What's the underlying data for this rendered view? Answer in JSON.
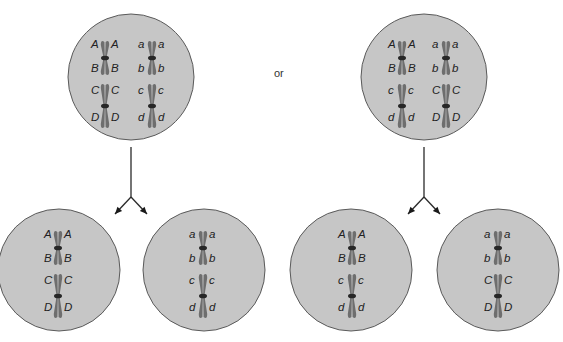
{
  "connector_label": "or",
  "colors": {
    "cell_fill": "#c6c6c6",
    "cell_stroke": "#5a5a5a",
    "chromatid": "#6e6e6e",
    "centromere": "#262626",
    "text": "#222222"
  },
  "arrangements": [
    {
      "name": "arrangement-1",
      "parent_cell": {
        "cx": 131,
        "cy": 77,
        "r": 63,
        "chromosomes": [
          {
            "x": 105,
            "cy": 58,
            "size": "small",
            "left_top": "A",
            "right_top": "A",
            "left_bottom": "B",
            "right_bottom": "B"
          },
          {
            "x": 152,
            "cy": 58,
            "size": "small",
            "left_top": "a",
            "right_top": "a",
            "left_bottom": "b",
            "right_bottom": "b"
          },
          {
            "x": 105,
            "cy": 106,
            "size": "large",
            "left_top": "C",
            "right_top": "C",
            "left_bottom": "D",
            "right_bottom": "D"
          },
          {
            "x": 152,
            "cy": 106,
            "size": "large",
            "left_top": "c",
            "right_top": "c",
            "left_bottom": "d",
            "right_bottom": "d"
          }
        ]
      },
      "daughter_cells": [
        {
          "cx": 59,
          "cy": 270,
          "r": 61,
          "chromosomes": [
            {
              "x": 58,
              "cy": 248,
              "size": "small",
              "left_top": "A",
              "right_top": "A",
              "left_bottom": "B",
              "right_bottom": "B"
            },
            {
              "x": 58,
              "cy": 296,
              "size": "large",
              "left_top": "C",
              "right_top": "C",
              "left_bottom": "D",
              "right_bottom": "D"
            }
          ]
        },
        {
          "cx": 204,
          "cy": 270,
          "r": 61,
          "chromosomes": [
            {
              "x": 203,
              "cy": 248,
              "size": "small",
              "left_top": "a",
              "right_top": "a",
              "left_bottom": "b",
              "right_bottom": "b"
            },
            {
              "x": 203,
              "cy": 296,
              "size": "large",
              "left_top": "c",
              "right_top": "c",
              "left_bottom": "d",
              "right_bottom": "d"
            }
          ]
        }
      ]
    },
    {
      "name": "arrangement-2",
      "parent_cell": {
        "cx": 424,
        "cy": 77,
        "r": 63,
        "chromosomes": [
          {
            "x": 402,
            "cy": 58,
            "size": "small",
            "left_top": "A",
            "right_top": "A",
            "left_bottom": "B",
            "right_bottom": "B"
          },
          {
            "x": 446,
            "cy": 58,
            "size": "small",
            "left_top": "a",
            "right_top": "a",
            "left_bottom": "b",
            "right_bottom": "b"
          },
          {
            "x": 402,
            "cy": 106,
            "size": "large",
            "left_top": "c",
            "right_top": "c",
            "left_bottom": "d",
            "right_bottom": "d"
          },
          {
            "x": 446,
            "cy": 106,
            "size": "large",
            "left_top": "C",
            "right_top": "C",
            "left_bottom": "D",
            "right_bottom": "D"
          }
        ]
      },
      "daughter_cells": [
        {
          "cx": 351,
          "cy": 270,
          "r": 61,
          "chromosomes": [
            {
              "x": 352,
              "cy": 248,
              "size": "small",
              "left_top": "A",
              "right_top": "A",
              "left_bottom": "B",
              "right_bottom": "B"
            },
            {
              "x": 352,
              "cy": 296,
              "size": "large",
              "left_top": "c",
              "right_top": "c",
              "left_bottom": "d",
              "right_bottom": "d"
            }
          ]
        },
        {
          "cx": 498,
          "cy": 270,
          "r": 61,
          "chromosomes": [
            {
              "x": 498,
              "cy": 248,
              "size": "small",
              "left_top": "a",
              "right_top": "a",
              "left_bottom": "b",
              "right_bottom": "b"
            },
            {
              "x": 498,
              "cy": 296,
              "size": "large",
              "left_top": "C",
              "right_top": "C",
              "left_bottom": "D",
              "right_bottom": "D"
            }
          ]
        }
      ]
    }
  ]
}
